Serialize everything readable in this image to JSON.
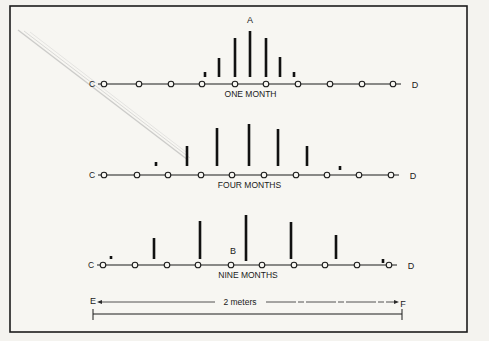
{
  "figure": {
    "point_labels": {
      "A": "A",
      "B": "B",
      "C": "C",
      "D": "D",
      "E": "E",
      "F": "F"
    },
    "rows": [
      {
        "caption": "ONE MONTH",
        "line_y": 84,
        "nodes_x": [
          104,
          139,
          171,
          202,
          235,
          266,
          298,
          330,
          362,
          393
        ],
        "bars": [
          {
            "x": 205,
            "top": 72,
            "bottom": 77
          },
          {
            "x": 219,
            "top": 58,
            "bottom": 77
          },
          {
            "x": 235,
            "top": 38,
            "bottom": 77
          },
          {
            "x": 250,
            "top": 31,
            "bottom": 77
          },
          {
            "x": 266,
            "top": 38,
            "bottom": 77
          },
          {
            "x": 280,
            "top": 57,
            "bottom": 77
          },
          {
            "x": 294,
            "top": 72,
            "bottom": 77
          }
        ]
      },
      {
        "caption": "FOUR MONTHS",
        "line_y": 175,
        "nodes_x": [
          104,
          137,
          168,
          201,
          232,
          264,
          296,
          327,
          359,
          391
        ],
        "bars": [
          {
            "x": 156,
            "top": 162,
            "bottom": 166
          },
          {
            "x": 187,
            "top": 146,
            "bottom": 166
          },
          {
            "x": 217,
            "top": 128,
            "bottom": 166
          },
          {
            "x": 249,
            "top": 124,
            "bottom": 166
          },
          {
            "x": 278,
            "top": 129,
            "bottom": 166
          },
          {
            "x": 307,
            "top": 146,
            "bottom": 166
          },
          {
            "x": 340,
            "top": 166,
            "bottom": 170
          }
        ]
      },
      {
        "caption": "NINE MONTHS",
        "line_y": 265,
        "nodes_x": [
          103,
          135,
          167,
          198,
          231,
          262,
          294,
          325,
          357,
          389
        ],
        "bars": [
          {
            "x": 111,
            "top": 256,
            "bottom": 259
          },
          {
            "x": 154,
            "top": 238,
            "bottom": 259
          },
          {
            "x": 200,
            "top": 221,
            "bottom": 259
          },
          {
            "x": 246,
            "top": 215,
            "bottom": 261
          },
          {
            "x": 291,
            "top": 222,
            "bottom": 259
          },
          {
            "x": 336,
            "top": 235,
            "bottom": 259
          },
          {
            "x": 383,
            "top": 259,
            "bottom": 263
          }
        ]
      }
    ],
    "scale": {
      "label": "2 meters",
      "left_label": "E",
      "right_label": "F"
    }
  }
}
